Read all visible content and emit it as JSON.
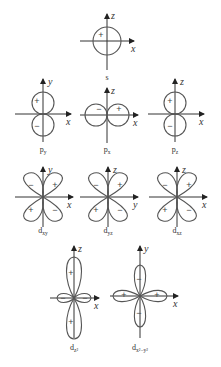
{
  "diagrams": {
    "s": {
      "label": "s",
      "sub": "",
      "axis_h": "x",
      "axis_v": "z",
      "signs": [
        "+"
      ]
    },
    "py": {
      "label": "p",
      "sub": "y",
      "axis_h": "x",
      "axis_v": "y",
      "signs": [
        "+",
        "−"
      ]
    },
    "px": {
      "label": "p",
      "sub": "x",
      "axis_h": "x",
      "axis_v": "z",
      "signs": [
        "−",
        "+"
      ]
    },
    "pz": {
      "label": "p",
      "sub": "z",
      "axis_h": "x",
      "axis_v": "z",
      "signs": [
        "+",
        "−"
      ]
    },
    "dxy": {
      "label": "d",
      "sub": "xy",
      "axis_h": "x",
      "axis_v": "y",
      "signs": [
        "−",
        "+",
        "+",
        "−"
      ]
    },
    "dyz": {
      "label": "d",
      "sub": "yz",
      "axis_h": "y",
      "axis_v": "z",
      "signs": [
        "−",
        "+",
        "+",
        "−"
      ]
    },
    "dxz": {
      "label": "d",
      "sub": "xz",
      "axis_h": "x",
      "axis_v": "z",
      "signs": [
        "−",
        "+",
        "+",
        "−"
      ]
    },
    "dz2": {
      "label": "d",
      "sub": "z²",
      "axis_h": "x",
      "axis_v": "z",
      "signs": [
        "+",
        "+",
        "−",
        "−"
      ]
    },
    "dx2y2": {
      "label": "d",
      "sub": "x²−y²",
      "axis_h": "x",
      "axis_v": "y",
      "signs": [
        "−",
        "−",
        "+",
        "+"
      ]
    }
  }
}
